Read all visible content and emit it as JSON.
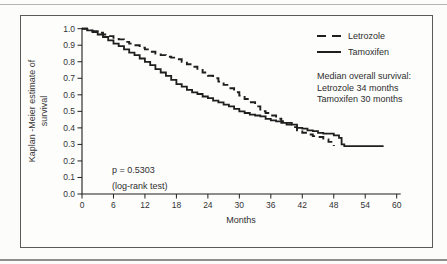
{
  "page": {
    "background": "#fcfcfa",
    "top_rule_color": "#b4b4b4",
    "bottom_rule_color": "#8e8e8e",
    "figure_border_color": "#5a5a5a"
  },
  "chart_data": {
    "type": "line",
    "subtype": "kaplan-meier-step",
    "title": "",
    "xlabel": "Months",
    "ylabel": "Kaplan -Meier estimate of survival",
    "ylabel_line1": "Kaplan -Meier estimate of",
    "ylabel_line2": "survival",
    "xlim": [
      0,
      60
    ],
    "ylim": [
      0.0,
      1.0
    ],
    "x_ticks": [
      "0",
      "6",
      "12",
      "18",
      "24",
      "30",
      "36",
      "42",
      "48",
      "54",
      "60"
    ],
    "y_ticks": [
      "1.0",
      "0.9",
      "0.8",
      "0.7",
      "0.6",
      "0.5",
      "0.4",
      "0.3",
      "0.2",
      "0.1",
      "0.0"
    ],
    "grid": false,
    "ink_color": "#1f1f1f",
    "legend_position": "top-right-inside",
    "series": [
      {
        "name": "Letrozole",
        "style": "dashed",
        "color": "#1f1f1f",
        "median_months": 34,
        "points": [
          [
            0,
            1.0
          ],
          [
            1,
            0.995
          ],
          [
            2,
            0.985
          ],
          [
            3,
            0.975
          ],
          [
            4,
            0.965
          ],
          [
            5,
            0.955
          ],
          [
            6,
            0.945
          ],
          [
            7,
            0.935
          ],
          [
            8,
            0.92
          ],
          [
            9,
            0.91
          ],
          [
            10,
            0.9
          ],
          [
            11,
            0.885
          ],
          [
            12,
            0.875
          ],
          [
            13,
            0.86
          ],
          [
            14,
            0.85
          ],
          [
            15,
            0.84
          ],
          [
            16,
            0.83
          ],
          [
            17,
            0.825
          ],
          [
            18,
            0.815
          ],
          [
            19,
            0.8
          ],
          [
            20,
            0.785
          ],
          [
            21,
            0.77
          ],
          [
            22,
            0.75
          ],
          [
            23,
            0.735
          ],
          [
            24,
            0.715
          ],
          [
            25,
            0.7
          ],
          [
            26,
            0.68
          ],
          [
            27,
            0.66
          ],
          [
            28,
            0.64
          ],
          [
            29,
            0.615
          ],
          [
            30,
            0.595
          ],
          [
            31,
            0.575
          ],
          [
            32,
            0.555
          ],
          [
            33,
            0.53
          ],
          [
            34,
            0.5
          ],
          [
            35,
            0.49
          ],
          [
            36,
            0.475
          ],
          [
            37,
            0.455
          ],
          [
            38,
            0.44
          ],
          [
            39,
            0.42
          ],
          [
            40,
            0.405
          ],
          [
            41,
            0.385
          ],
          [
            42,
            0.37
          ],
          [
            43,
            0.36
          ],
          [
            44,
            0.35
          ],
          [
            45,
            0.345
          ],
          [
            46,
            0.33
          ],
          [
            47,
            0.315
          ],
          [
            48,
            0.29
          ]
        ]
      },
      {
        "name": "Tamoxifen",
        "style": "solid",
        "color": "#1f1f1f",
        "median_months": 30,
        "points": [
          [
            0,
            1.0
          ],
          [
            1,
            0.99
          ],
          [
            2,
            0.98
          ],
          [
            3,
            0.965
          ],
          [
            4,
            0.95
          ],
          [
            5,
            0.93
          ],
          [
            6,
            0.91
          ],
          [
            7,
            0.895
          ],
          [
            8,
            0.875
          ],
          [
            9,
            0.855
          ],
          [
            10,
            0.84
          ],
          [
            11,
            0.82
          ],
          [
            12,
            0.8
          ],
          [
            13,
            0.78
          ],
          [
            14,
            0.755
          ],
          [
            15,
            0.735
          ],
          [
            16,
            0.715
          ],
          [
            17,
            0.69
          ],
          [
            18,
            0.665
          ],
          [
            19,
            0.65
          ],
          [
            20,
            0.63
          ],
          [
            21,
            0.615
          ],
          [
            22,
            0.605
          ],
          [
            23,
            0.59
          ],
          [
            24,
            0.58
          ],
          [
            25,
            0.565
          ],
          [
            26,
            0.555
          ],
          [
            27,
            0.54
          ],
          [
            28,
            0.53
          ],
          [
            29,
            0.515
          ],
          [
            30,
            0.5
          ],
          [
            31,
            0.49
          ],
          [
            32,
            0.48
          ],
          [
            33,
            0.475
          ],
          [
            34,
            0.47
          ],
          [
            35,
            0.455
          ],
          [
            36,
            0.445
          ],
          [
            37,
            0.44
          ],
          [
            38,
            0.43
          ],
          [
            40,
            0.42
          ],
          [
            41,
            0.4
          ],
          [
            42,
            0.395
          ],
          [
            43,
            0.385
          ],
          [
            44,
            0.38
          ],
          [
            45,
            0.37
          ],
          [
            46,
            0.365
          ],
          [
            48,
            0.355
          ],
          [
            49,
            0.34
          ],
          [
            49.5,
            0.3
          ],
          [
            50,
            0.29
          ],
          [
            57.5,
            0.29
          ]
        ]
      }
    ],
    "annotations": {
      "p_value_line1": "p  =  0.5303",
      "p_value_line2": "(log-rank test)",
      "median_title": "Median overall survival:",
      "median_letrozole": "Letrozole  34 months",
      "median_tamoxifen": "Tamoxifen  30 months"
    }
  }
}
